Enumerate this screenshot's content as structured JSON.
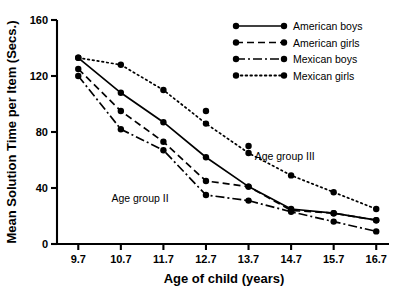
{
  "chart_data": {
    "type": "line",
    "title": "",
    "xlabel": "Age of child (years)",
    "ylabel": "Mean Solution Time per Item (Secs.)",
    "x": [
      9.7,
      10.7,
      11.7,
      12.7,
      13.7,
      14.7,
      15.7,
      16.7
    ],
    "xticklabels": [
      "9.7",
      "10.7",
      "11.7",
      "12.7",
      "13.7",
      "14.7",
      "15.7",
      "16.7"
    ],
    "yticklabels": [
      "0",
      "40",
      "80",
      "120",
      "160"
    ],
    "yticks": [
      0,
      40,
      80,
      120,
      160
    ],
    "xlim": [
      9.2,
      17.0
    ],
    "ylim": [
      0,
      160
    ],
    "grid": false,
    "legend_position": "top-right",
    "series": [
      {
        "name": "American boys",
        "style": "solid",
        "marker": "filled-circle",
        "values": [
          133,
          108,
          87,
          62,
          41,
          25,
          22,
          17
        ]
      },
      {
        "name": "American girls",
        "style": "dashed",
        "marker": "filled-circle",
        "values": [
          125,
          95,
          73,
          45,
          41,
          24,
          22,
          17
        ]
      },
      {
        "name": "Mexican boys",
        "style": "dash-dot",
        "marker": "filled-circle",
        "values": [
          120,
          82,
          67,
          35,
          31,
          23,
          16,
          9
        ]
      },
      {
        "name": "Mexican girls",
        "style": "dotted",
        "marker": "filled-circle",
        "values": [
          133,
          128,
          110,
          86,
          65,
          49,
          37,
          25
        ],
        "extra_points": [
          {
            "x": 12.7,
            "y": 95
          },
          {
            "x": 13.7,
            "y": 70
          }
        ]
      }
    ],
    "annotations": [
      {
        "text": "Age group II",
        "x": 11.15,
        "y": 30
      },
      {
        "text": "Age group III",
        "x": 14.55,
        "y": 60
      }
    ]
  },
  "legend": {
    "items": [
      {
        "label": "American boys",
        "style": "solid"
      },
      {
        "label": "American girls",
        "style": "dashed"
      },
      {
        "label": "Mexican boys",
        "style": "dash-dot"
      },
      {
        "label": "Mexican girls",
        "style": "dotted"
      }
    ]
  },
  "axes": {
    "x_title": "Age of child (years)",
    "y_title": "Mean Solution Time per Item (Secs.)"
  },
  "colors": {
    "ink": "#000000",
    "background": "#ffffff"
  }
}
